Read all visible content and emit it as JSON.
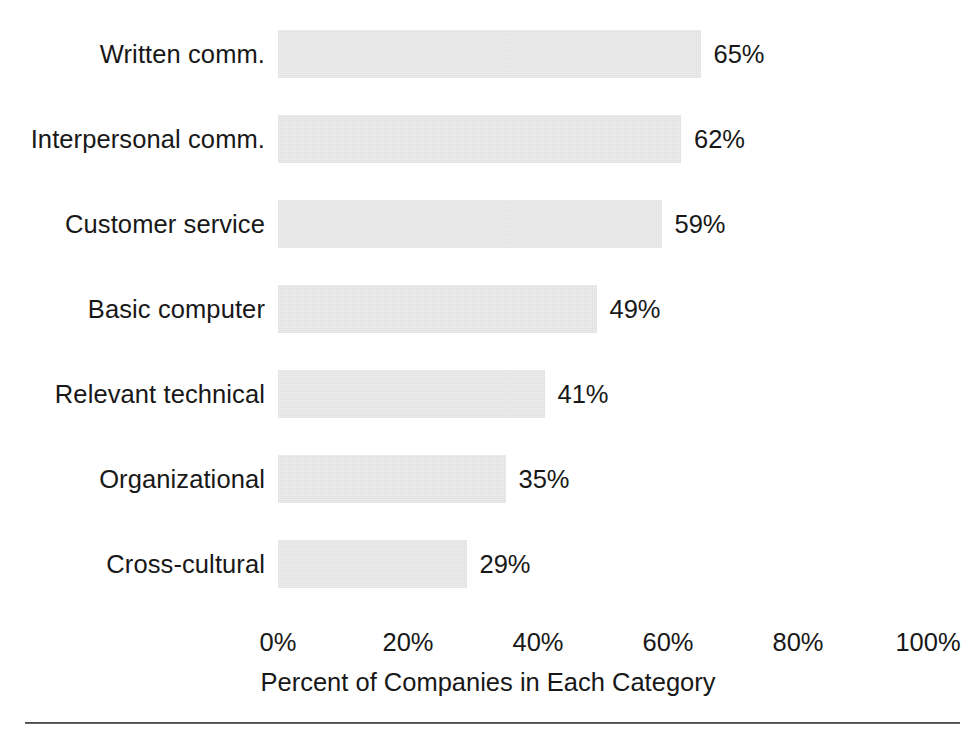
{
  "chart_data": {
    "type": "bar",
    "orientation": "horizontal",
    "title": "",
    "xlabel": "Percent of Companies in Each Category",
    "ylabel": "",
    "categories": [
      "Written comm.",
      "Interpersonal comm.",
      "Customer service",
      "Basic computer",
      "Relevant technical",
      "Organizational",
      "Cross-cultural"
    ],
    "values": [
      65,
      62,
      59,
      49,
      41,
      35,
      29
    ],
    "value_labels": [
      "65%",
      "62%",
      "59%",
      "49%",
      "41%",
      "35%",
      "29%"
    ],
    "xlim": [
      0,
      100
    ],
    "xticks": [
      0,
      20,
      40,
      60,
      80,
      100
    ],
    "xtick_labels": [
      "0%",
      "20%",
      "40%",
      "60%",
      "80%",
      "100%"
    ],
    "grid": false,
    "legend": null,
    "bar_color": "#ededed",
    "text_color": "#181818"
  },
  "axis": {
    "title": "Percent of Companies in Each Category"
  }
}
